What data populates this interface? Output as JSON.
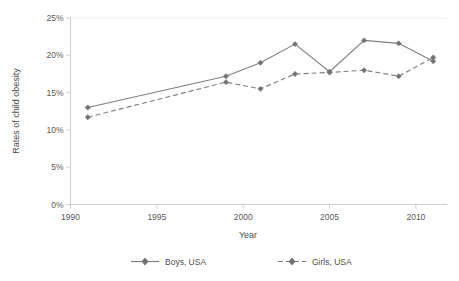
{
  "chart_data": {
    "type": "line",
    "title": "",
    "xlabel": "Year",
    "ylabel": "Rates of child obesity",
    "x": [
      1991,
      1999,
      2001,
      2003,
      2005,
      2007,
      2009,
      2011
    ],
    "xlim": [
      1990,
      2011.8
    ],
    "ylim": [
      0,
      25
    ],
    "xticks": [
      1990,
      1995,
      2000,
      2005,
      2010
    ],
    "xtick_labels": [
      "1990",
      "1995",
      "2000",
      "2005",
      "2010"
    ],
    "yticks": [
      0,
      5,
      10,
      15,
      20,
      25
    ],
    "ytick_labels": [
      "0%",
      "5%",
      "10%",
      "15%",
      "20%",
      "25%"
    ],
    "grid": "horizontal-top-only",
    "legend_position": "bottom",
    "series": [
      {
        "name": "Boys, USA",
        "style": "solid",
        "marker": "diamond",
        "color": "#808080",
        "values": [
          13.0,
          17.2,
          19.0,
          21.5,
          17.8,
          22.0,
          21.6,
          19.2
        ]
      },
      {
        "name": "Girls, USA",
        "style": "dashed",
        "marker": "diamond",
        "color": "#808080",
        "values": [
          11.7,
          16.4,
          15.5,
          17.5,
          17.7,
          18.0,
          17.2,
          19.7
        ]
      }
    ]
  },
  "axes": {
    "x_title": "Year",
    "y_title": "Rates of child obesity"
  },
  "legend": {
    "items": [
      {
        "label": "Boys, USA"
      },
      {
        "label": "Girls, USA"
      }
    ]
  }
}
